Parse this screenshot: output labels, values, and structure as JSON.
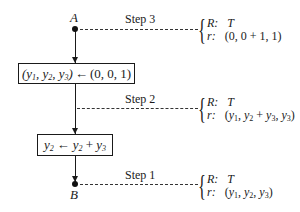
{
  "diagram": {
    "points": {
      "start": "A",
      "end": "B"
    },
    "boxes": [
      {
        "lhs": "(y1, y2, y3)",
        "arrow": "←",
        "rhs": "(0, 0, 1)"
      },
      {
        "lhs": "y2",
        "arrow": "←",
        "rhs": "y2 + y3"
      }
    ],
    "steps": [
      {
        "label": "Step 3",
        "R_key": "R:",
        "R_val": "T",
        "r_key": "r:",
        "r_val": "(0, 0 + 1, 1)"
      },
      {
        "label": "Step 2",
        "R_key": "R:",
        "R_val": "T",
        "r_key": "r:",
        "r_val": "(y1, y2 + y3, y3)"
      },
      {
        "label": "Step 1",
        "R_key": "R:",
        "R_val": "T",
        "r_key": "r:",
        "r_val": "(y1, y2, y3)"
      }
    ]
  }
}
